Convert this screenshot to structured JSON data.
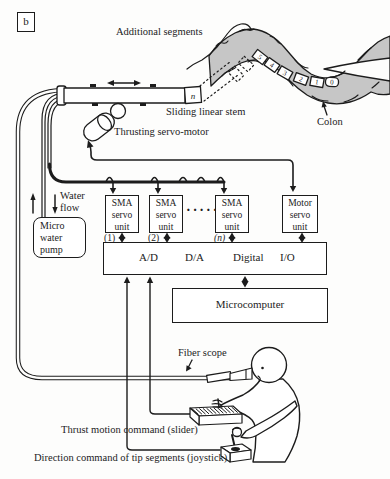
{
  "figure": {
    "panel_label": "b",
    "annotations": {
      "additional_segments": "Additional segments",
      "colon": "Colon",
      "sliding_linear_stem": "Sliding linear stem",
      "thrusting_servo_motor": "Thrusting servo-motor",
      "water_flow_line1": "Water",
      "water_flow_line2": "flow",
      "fiber_scope": "Fiber scope",
      "thrust_command": "Thrust motion command (slider)",
      "direction_command": "Direction command of tip segments (joystick)"
    },
    "stem": {
      "segment_label": "n"
    },
    "robot_segments": [
      "5",
      "4",
      "3",
      "2",
      "1",
      "0"
    ],
    "boxes": {
      "micro_water_pump": {
        "line1": "Micro",
        "line2": "water",
        "line3": "pump"
      },
      "sma_unit_1": {
        "line1": "SMA",
        "line2": "servo",
        "line3": "unit",
        "index": "(1)"
      },
      "sma_unit_2": {
        "line1": "SMA",
        "line2": "servo",
        "line3": "unit",
        "index": "(2)"
      },
      "sma_unit_n": {
        "line1": "SMA",
        "line2": "servo",
        "line3": "unit",
        "index": "(n)"
      },
      "ellipsis": "·····",
      "motor_servo_unit": {
        "line1": "Motor",
        "line2": "servo",
        "line3": "unit"
      },
      "interface": {
        "item1": "A/D",
        "item2": "D/A",
        "item3": "Digital",
        "item4": "I/O"
      },
      "microcomputer": "Microcomputer"
    },
    "colors": {
      "ink": "#1c1c1c",
      "colon_fill": "#c6c6c6",
      "background": "#ffffff"
    }
  }
}
